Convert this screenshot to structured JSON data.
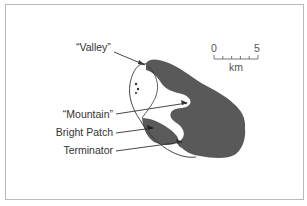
{
  "labels": {
    "valley": "“Valley”",
    "mountain": "“Mountain”",
    "bright_patch": "Bright Patch",
    "terminator": "Terminator"
  },
  "scale_bar": {
    "start": "0",
    "end": "5",
    "unit": "km",
    "ticks": 6
  },
  "colors": {
    "body_fill": "#555555",
    "line": "#333333",
    "frame": "#b8b8b8"
  }
}
